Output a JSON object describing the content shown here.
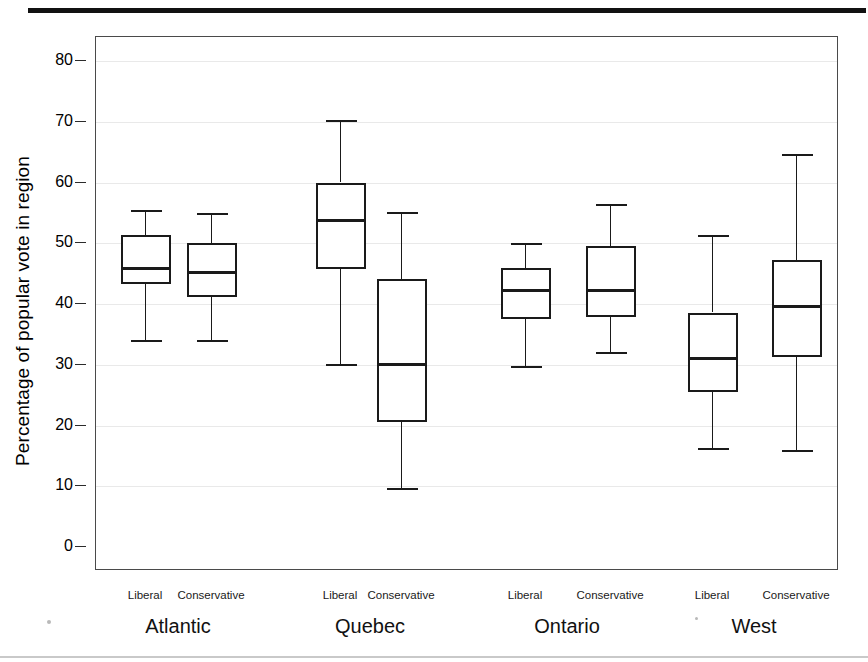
{
  "chart_data": {
    "type": "box",
    "title": "",
    "xlabel": "",
    "ylabel": "Percentage of popular vote in region",
    "ylim": [
      0,
      83
    ],
    "yticks": [
      0,
      10,
      20,
      30,
      40,
      50,
      60,
      70,
      80
    ],
    "ytick_labels": [
      "0",
      "10",
      "20",
      "30",
      "40",
      "50",
      "60",
      "70",
      "80"
    ],
    "grid": true,
    "grid_axis": "y",
    "legend": "none",
    "groups": [
      "Atlantic",
      "Quebec",
      "Ontario",
      "West"
    ],
    "series": [
      "Liberal",
      "Conservative"
    ],
    "boxes": [
      {
        "group": "Atlantic",
        "series": "Liberal",
        "whisker_low": 34.0,
        "q1": 43.3,
        "median": 45.9,
        "q3": 51.3,
        "whisker_high": 55.5
      },
      {
        "group": "Atlantic",
        "series": "Conservative",
        "whisker_low": 34.1,
        "q1": 41.2,
        "median": 45.2,
        "q3": 50.1,
        "whisker_high": 54.9
      },
      {
        "group": "Quebec",
        "series": "Liberal",
        "whisker_low": 30.2,
        "q1": 45.7,
        "median": 53.7,
        "q3": 60.0,
        "whisker_high": 70.3
      },
      {
        "group": "Quebec",
        "series": "Conservative",
        "whisker_low": 9.7,
        "q1": 20.5,
        "median": 30.1,
        "q3": 44.1,
        "whisker_high": 55.1
      },
      {
        "group": "Ontario",
        "series": "Liberal",
        "whisker_low": 29.8,
        "q1": 37.6,
        "median": 42.2,
        "q3": 46.0,
        "whisker_high": 50.1
      },
      {
        "group": "Ontario",
        "series": "Conservative",
        "whisker_low": 32.1,
        "q1": 37.8,
        "median": 42.3,
        "q3": 49.5,
        "whisker_high": 56.4
      },
      {
        "group": "West",
        "series": "Liberal",
        "whisker_low": 16.3,
        "q1": 25.5,
        "median": 31.0,
        "q3": 38.6,
        "whisker_high": 51.4
      },
      {
        "group": "West",
        "series": "Conservative",
        "whisker_low": 15.9,
        "q1": 31.2,
        "median": 39.6,
        "q3": 47.2,
        "whisker_high": 64.7
      }
    ]
  },
  "layout": {
    "plot": {
      "left": 95,
      "top": 36,
      "width": 743,
      "height": 534
    },
    "y_zero_px": 546,
    "px_per_unit": 6.075,
    "box_width": 50,
    "centers": [
      145,
      211,
      340,
      401,
      525,
      610,
      712,
      796
    ],
    "group_centers": [
      178,
      370,
      567,
      754
    ],
    "series_label_y": 589,
    "group_label_y": 615
  }
}
